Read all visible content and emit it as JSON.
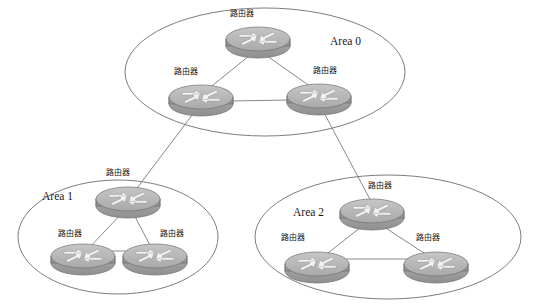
{
  "diagram": {
    "type": "network-topology",
    "background_color": "#ffffff",
    "stroke_color": "#6e6e6e",
    "router_body_color": "#a8a8a8",
    "router_top_color": "#b8b8b8",
    "width": 535,
    "height": 305,
    "areas": [
      {
        "id": "area0",
        "label": "Area 0",
        "label_x": 330,
        "label_y": 45,
        "ellipse": {
          "cx": 265,
          "cy": 72,
          "rx": 140,
          "ry": 64
        },
        "routers": [
          {
            "id": "a0-top",
            "label": "路由器",
            "x": 258,
            "y": 40,
            "label_x": 242,
            "label_y": 16
          },
          {
            "id": "a0-left",
            "label": "路由器",
            "x": 201,
            "y": 98,
            "label_x": 186,
            "label_y": 74
          },
          {
            "id": "a0-right",
            "label": "路由器",
            "x": 319,
            "y": 97,
            "label_x": 325,
            "label_y": 73
          }
        ],
        "internal_links": [
          {
            "from": "a0-top",
            "to": "a0-left"
          },
          {
            "from": "a0-top",
            "to": "a0-right"
          },
          {
            "from": "a0-left",
            "to": "a0-right"
          }
        ]
      },
      {
        "id": "area1",
        "label": "Area 1",
        "label_x": 42,
        "label_y": 200,
        "ellipse": {
          "cx": 118,
          "cy": 237,
          "rx": 100,
          "ry": 57
        },
        "routers": [
          {
            "id": "a1-top",
            "label": "路由器",
            "x": 128,
            "y": 200,
            "label_x": 118,
            "label_y": 175
          },
          {
            "id": "a1-bottom-left",
            "label": "路由器",
            "x": 83,
            "y": 257,
            "label_x": 70,
            "label_y": 236
          },
          {
            "id": "a1-bottom-right",
            "label": "路由器",
            "x": 155,
            "y": 257,
            "label_x": 172,
            "label_y": 236
          }
        ],
        "internal_links": [
          {
            "from": "a1-top",
            "to": "a1-bottom-left"
          },
          {
            "from": "a1-top",
            "to": "a1-bottom-right"
          },
          {
            "from": "a1-bottom-left",
            "to": "a1-bottom-right"
          }
        ]
      },
      {
        "id": "area2",
        "label": "Area 2",
        "label_x": 293,
        "label_y": 216,
        "ellipse": {
          "cx": 388,
          "cy": 237,
          "rx": 133,
          "ry": 62
        },
        "routers": [
          {
            "id": "a2-top",
            "label": "路由器",
            "x": 372,
            "y": 212,
            "label_x": 380,
            "label_y": 188
          },
          {
            "id": "a2-bottom-left",
            "label": "路由器",
            "x": 317,
            "y": 265,
            "label_x": 293,
            "label_y": 240
          },
          {
            "id": "a2-bottom-right",
            "label": "路由器",
            "x": 436,
            "y": 265,
            "label_x": 428,
            "label_y": 240
          }
        ],
        "internal_links": [
          {
            "from": "a2-top",
            "to": "a2-bottom-left"
          },
          {
            "from": "a2-top",
            "to": "a2-bottom-right"
          },
          {
            "from": "a2-bottom-left",
            "to": "a2-bottom-right"
          }
        ]
      }
    ],
    "inter_area_links": [
      {
        "from": "a0-left",
        "to": "a1-top",
        "from_area": "area0",
        "to_area": "area1"
      },
      {
        "from": "a0-right",
        "to": "a2-top",
        "from_area": "area0",
        "to_area": "area2"
      }
    ],
    "router_icon_name": "router-icon",
    "router_label_text": "路由器"
  }
}
